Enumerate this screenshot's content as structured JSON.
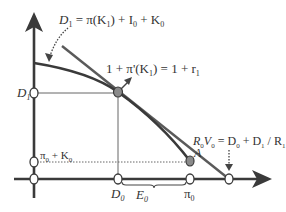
{
  "diagram": {
    "type": "economics-intertemporal-investment",
    "colors": {
      "axis": "#3a3a3a",
      "curve": "#3a3a3a",
      "budget_line": "#5a5a5a",
      "guide": "#555555",
      "point_fill": "#8a8a8a",
      "open_point_fill": "#ffffff"
    },
    "labels": {
      "d1_equation": {
        "lhs": "D",
        "lhs_sub": "1",
        "rhs_a": " = π(K",
        "rhs_a_sub": "1",
        "rhs_b": ") + I",
        "rhs_b_sub": "0",
        "rhs_c": " + K",
        "rhs_c_sub": "0"
      },
      "tangent_equation": {
        "part_a": "1 + π'(K",
        "part_a_sub": "1",
        "part_b": ") = 1 + r",
        "part_b_sub": "1"
      },
      "rv_equation": {
        "r": "R",
        "r_sub": "0",
        "v": "V",
        "v_sub": "0",
        "eq": " = D",
        "eq_sub": "0",
        "plus": " + D",
        "plus_sub": "1",
        "div": " / R",
        "div_sub": "1"
      },
      "y_axis_d1": {
        "main": "D",
        "sub": "1"
      },
      "y_axis_pi0k0": {
        "a": "π",
        "a_sub": "0",
        "b": " + K",
        "b_sub": "0"
      },
      "x_axis_d0": {
        "main": "D",
        "sub": "0"
      },
      "x_axis_e0": {
        "main": "E",
        "sub": "0"
      },
      "x_axis_pi0": {
        "main": "π",
        "sub": "0"
      },
      "point_a": "A"
    },
    "points": [
      {
        "name": "tangent-point",
        "x": 118,
        "y": 92,
        "filled": true
      },
      {
        "name": "point-a",
        "x": 190,
        "y": 161,
        "filled": true
      },
      {
        "name": "y-d1",
        "x": 34,
        "y": 93,
        "filled": false
      },
      {
        "name": "y-pi0k0",
        "x": 34,
        "y": 162,
        "filled": false
      },
      {
        "name": "origin",
        "x": 34,
        "y": 179,
        "filled": false
      },
      {
        "name": "x-d0",
        "x": 118,
        "y": 179,
        "filled": false
      },
      {
        "name": "x-pi0",
        "x": 190,
        "y": 179,
        "filled": false
      },
      {
        "name": "x-r0v0",
        "x": 229,
        "y": 179,
        "filled": false
      }
    ]
  }
}
